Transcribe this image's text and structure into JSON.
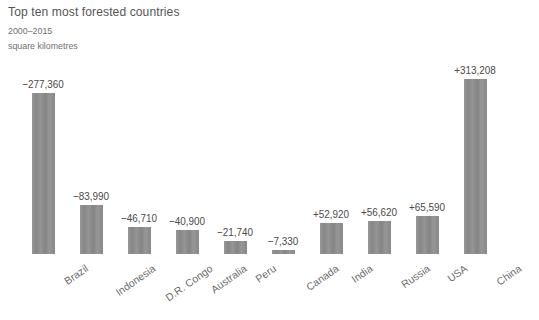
{
  "header": {
    "title": "Top ten most forested countries",
    "subtitle": "2000–2015",
    "units": "square kilometres"
  },
  "chart_data": {
    "type": "bar",
    "title": "Top ten most forested countries",
    "subtitle": "2000–2015",
    "xlabel": "",
    "ylabel": "square kilometres",
    "grid": false,
    "legend": false,
    "axis_baseline": 0,
    "ylim": [
      -277360,
      313208
    ],
    "categories": [
      "Brazil",
      "Indonesia",
      "D.R. Congo",
      "Australia",
      "Peru",
      "Canada",
      "India",
      "Russia",
      "USA",
      "China"
    ],
    "values": [
      -277360,
      -83990,
      -46710,
      -40900,
      -21740,
      -7330,
      52920,
      56620,
      65590,
      313208
    ],
    "value_labels": [
      "−277,360",
      "−83,990",
      "−46,710",
      "−40,900",
      "−21,740",
      "−7,330",
      "+52,920",
      "+56,620",
      "+65,590",
      "+313,208"
    ],
    "bar_color": "#8c8c8c",
    "background_color": "#ffffff",
    "text_color": "#5b5b5b"
  }
}
